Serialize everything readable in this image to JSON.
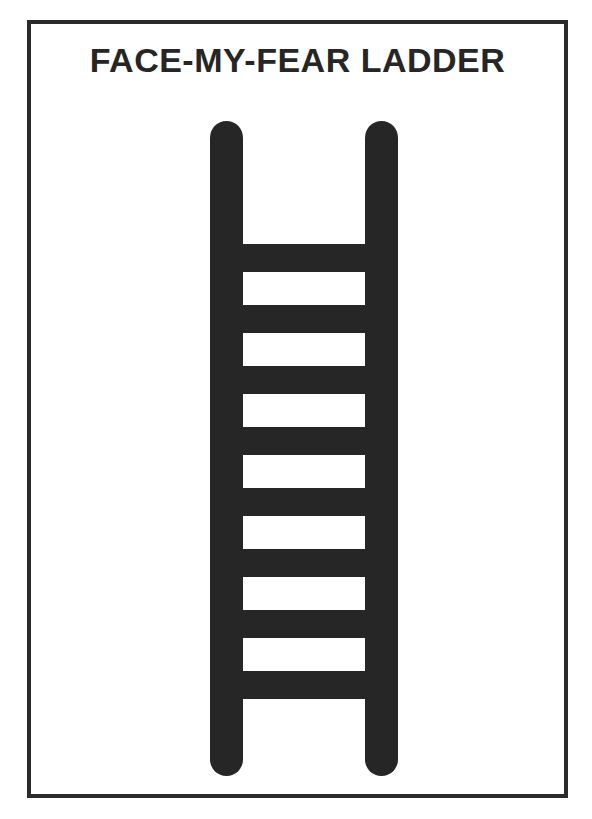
{
  "page": {
    "background_color": "#ffffff",
    "width": 592,
    "height": 819
  },
  "frame": {
    "border_color": "#2b2b2b",
    "border_width_px": 4
  },
  "title": {
    "text": "FACE-MY-FEAR LADDER",
    "color": "#262626",
    "align": "center",
    "weight": "bold"
  },
  "ladder": {
    "icon_name": "ladder-icon",
    "color": "#262626",
    "rail_count": 2,
    "rung_count": 8,
    "gap_count": 7,
    "rail_width_px": 33,
    "rail_cap": "rounded",
    "rung_height_px": 28,
    "gap_height_px": 33,
    "rails": [
      {
        "name": "left-rail",
        "x": 15,
        "y": 11,
        "width": 33,
        "height": 655
      },
      {
        "name": "right-rail",
        "x": 170,
        "y": 11,
        "width": 33,
        "height": 655
      }
    ],
    "rungs": [
      {
        "label": "rung-1",
        "y": 134
      },
      {
        "label": "rung-2",
        "y": 195
      },
      {
        "label": "rung-3",
        "y": 256
      },
      {
        "label": "rung-4",
        "y": 317
      },
      {
        "label": "rung-5",
        "y": 378
      },
      {
        "label": "rung-6",
        "y": 439
      },
      {
        "label": "rung-7",
        "y": 500
      },
      {
        "label": "rung-8",
        "y": 561
      }
    ],
    "rung_x": 40,
    "rung_width": 138
  }
}
